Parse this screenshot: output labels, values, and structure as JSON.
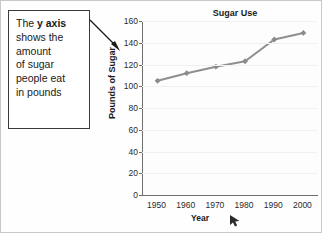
{
  "callout": {
    "lines": [
      {
        "pre": "The ",
        "bold": "y axis",
        "post": ""
      },
      {
        "pre": "shows the",
        "bold": "",
        "post": ""
      },
      {
        "pre": "amount",
        "bold": "",
        "post": ""
      },
      {
        "pre": "of sugar",
        "bold": "",
        "post": ""
      },
      {
        "pre": "people eat",
        "bold": "",
        "post": ""
      },
      {
        "pre": "in pounds",
        "bold": "",
        "post": ""
      }
    ],
    "arrow_name": "callout-pointer-arrow"
  },
  "colors": {
    "line": "#8f8f8f",
    "marker": "#8a8a8a",
    "axis": "#6e6e6e",
    "grid": "#f0f0f0",
    "text": "#1a1a1a",
    "box_border": "#3a3a3a"
  },
  "chart_data": {
    "type": "line",
    "title": "Sugar Use",
    "xlabel": "Year",
    "ylabel": "Pounds of Sugar",
    "x": [
      1950,
      1960,
      1970,
      1980,
      1990,
      2000
    ],
    "categories": [
      "1950",
      "1960",
      "1970",
      "1980",
      "1990",
      "2000"
    ],
    "values": [
      105,
      112,
      118,
      123,
      143,
      149
    ],
    "xticklabels": [
      "1950",
      "1960",
      "1970",
      "1980",
      "1990",
      "2000"
    ],
    "yticklabels": [
      "160",
      "140",
      "120",
      "100",
      "80",
      "60",
      "40",
      "20",
      "0"
    ],
    "yticks": [
      160,
      140,
      120,
      100,
      80,
      60,
      40,
      20,
      0
    ],
    "ylim": [
      0,
      160
    ],
    "xlim": [
      1945,
      2005
    ],
    "grid": true,
    "legend": false,
    "marker": "diamond"
  },
  "cursor": {
    "name": "mouse-pointer-arrow"
  }
}
